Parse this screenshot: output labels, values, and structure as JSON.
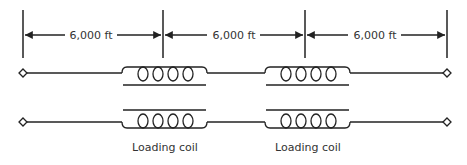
{
  "diagram": {
    "stroke_color": "#222222",
    "dimensions": [
      {
        "label": "6,000 ft",
        "x1": 23,
        "x2": 163
      },
      {
        "label": "6,000 ft",
        "x1": 163,
        "x2": 305
      },
      {
        "label": "6,000 ft",
        "x1": 305,
        "x2": 447
      }
    ],
    "coils": [
      {
        "label": "Loading coil",
        "x": 122,
        "width": 85
      },
      {
        "label": "Loading coil",
        "x": 265,
        "width": 85
      }
    ]
  }
}
